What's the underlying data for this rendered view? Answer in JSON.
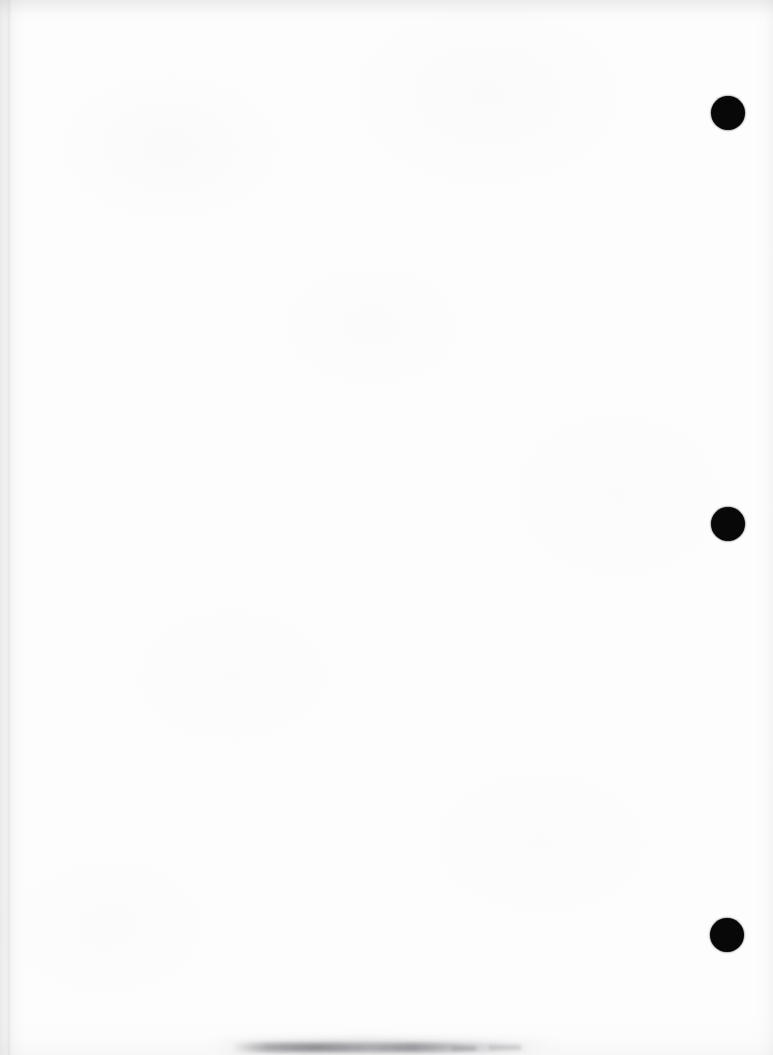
{
  "document": {
    "kind": "scanned-page",
    "description": "Blank scanned sheet of paper",
    "page_text": "",
    "width_px": 773,
    "height_px": 1055,
    "background_color": "#fdfdfd"
  },
  "marks": {
    "punch_holes": [
      {
        "name": "punch-hole-top",
        "x": 711,
        "y": 96,
        "diameter": 34,
        "color": "#080808"
      },
      {
        "name": "punch-hole-middle",
        "x": 711,
        "y": 507,
        "diameter": 34,
        "color": "#080808"
      },
      {
        "name": "punch-hole-bottom",
        "x": 710,
        "y": 918,
        "diameter": 34,
        "color": "#080808"
      }
    ],
    "bottom_smudge": {
      "name": "bottom-edge-smudge",
      "x": 232,
      "y": 1043,
      "width": 300,
      "height": 9,
      "color": "#5c5c61"
    },
    "edge_shadows": {
      "left_color": "#8a8a8f",
      "top_color": "#8e8e94",
      "right_color": "#96969c"
    }
  }
}
